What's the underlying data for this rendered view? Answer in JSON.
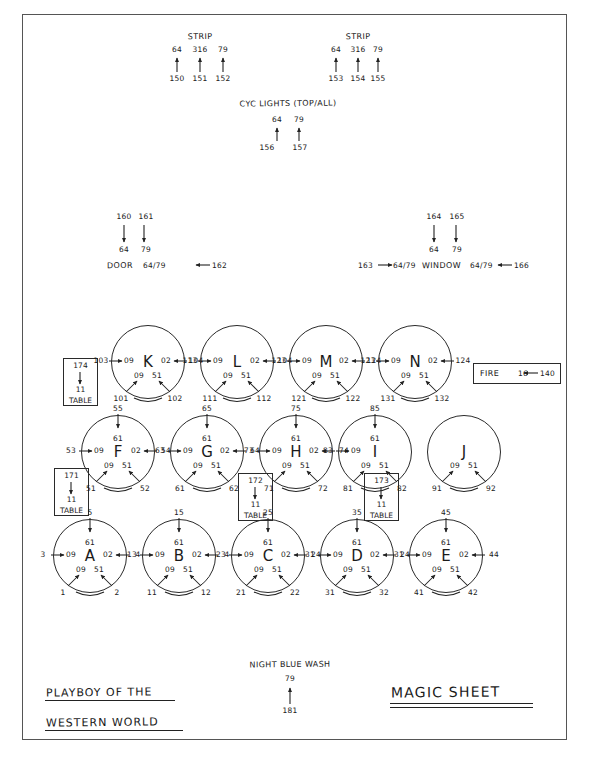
{
  "document": {
    "title_line1": "PLAYBOY OF THE",
    "title_line2": "WESTERN WORLD",
    "sheet_title": "MAGIC SHEET"
  },
  "strips": [
    {
      "name": "strip-left",
      "label": "STRIP",
      "colors": [
        "64",
        "316",
        "79"
      ],
      "channels": [
        "150",
        "151",
        "152"
      ]
    },
    {
      "name": "strip-right",
      "label": "STRIP",
      "colors": [
        "64",
        "316",
        "79"
      ],
      "channels": [
        "153",
        "154",
        "155"
      ]
    }
  ],
  "cyc": {
    "label": "CYC LIGHTS (TOP/ALL)",
    "colors": [
      "64",
      "79"
    ],
    "channels": [
      "156",
      "157"
    ]
  },
  "door": {
    "label": "DOOR",
    "top_channels": [
      "160",
      "161"
    ],
    "top_colors": [
      "64",
      "79"
    ],
    "side_channel": "162",
    "side_colors": "64/79"
  },
  "window": {
    "label": "WINDOW",
    "top_channels": [
      "164",
      "165"
    ],
    "top_colors": [
      "64",
      "79"
    ],
    "left_channel": "163",
    "left_colors": "64/79",
    "right_channel": "166",
    "right_colors": "64/79"
  },
  "fire": {
    "label": "FIRE",
    "color": "16",
    "channel": "140"
  },
  "night_blue_wash": {
    "label": "NIGHT BLUE WASH",
    "color": "79",
    "channel": "181"
  },
  "tables": [
    {
      "name": "table-box-1",
      "channel": "174",
      "color": "11",
      "label": "TABLE"
    },
    {
      "name": "table-box-2",
      "channel": "171",
      "color": "11",
      "label": "TABLE"
    },
    {
      "name": "table-box-3",
      "channel": "172",
      "color": "11",
      "label": "TABLE"
    },
    {
      "name": "table-box-4",
      "channel": "173",
      "color": "11",
      "label": "TABLE"
    }
  ],
  "areas": [
    {
      "letter": "K",
      "row": 1,
      "left_channel": "103",
      "left_color": "09",
      "right_color": "02",
      "right_channel": "104",
      "down_colors": [
        "09",
        "51"
      ],
      "down_channels": [
        "101",
        "102"
      ],
      "top_channel": "",
      "top_color": ""
    },
    {
      "letter": "L",
      "row": 1,
      "left_channel": "113",
      "left_color": "09",
      "right_color": "02",
      "right_channel": "104",
      "down_colors": [
        "09",
        "51"
      ],
      "down_channels": [
        "111",
        "112"
      ],
      "top_channel": "",
      "top_color": ""
    },
    {
      "letter": "M",
      "row": 1,
      "left_channel": "123",
      "left_color": "09",
      "right_color": "02",
      "right_channel": "124",
      "down_colors": [
        "09",
        "51"
      ],
      "down_channels": [
        "121",
        "122"
      ],
      "top_channel": "",
      "top_color": ""
    },
    {
      "letter": "N",
      "row": 1,
      "left_channel": "123",
      "left_color": "09",
      "right_color": "02",
      "right_channel": "124",
      "down_colors": [
        "09",
        "51"
      ],
      "down_channels": [
        "131",
        "132"
      ],
      "top_channel": "",
      "top_color": ""
    },
    {
      "letter": "F",
      "row": 2,
      "left_channel": "53",
      "left_color": "09",
      "right_color": "02",
      "right_channel": "54",
      "down_colors": [
        "09",
        "51"
      ],
      "down_channels": [
        "51",
        "52"
      ],
      "top_channel": "55",
      "top_color": "61"
    },
    {
      "letter": "G",
      "row": 2,
      "left_channel": "63",
      "left_color": "09",
      "right_color": "02",
      "right_channel": "64",
      "down_colors": [
        "09",
        "51"
      ],
      "down_channels": [
        "61",
        "62"
      ],
      "top_channel": "65",
      "top_color": "61"
    },
    {
      "letter": "H",
      "row": 2,
      "left_channel": "73",
      "left_color": "09",
      "right_color": "02",
      "right_channel": "74",
      "down_colors": [
        "09",
        "51"
      ],
      "down_channels": [
        "71",
        "72"
      ],
      "top_channel": "75",
      "top_color": "61"
    },
    {
      "letter": "I",
      "row": 2,
      "left_channel": "83",
      "left_color": "09",
      "right_color": "",
      "right_channel": "",
      "down_colors": [
        "09",
        "51"
      ],
      "down_channels": [
        "81",
        "82"
      ],
      "top_channel": "85",
      "top_color": "61"
    },
    {
      "letter": "J",
      "row": 2,
      "left_channel": "",
      "left_color": "",
      "right_color": "",
      "right_channel": "",
      "down_colors": [
        "09",
        "51"
      ],
      "down_channels": [
        "91",
        "92"
      ],
      "top_channel": "",
      "top_color": ""
    },
    {
      "letter": "A",
      "row": 3,
      "left_channel": "3",
      "left_color": "09",
      "right_color": "02",
      "right_channel": "4",
      "down_colors": [
        "09",
        "51"
      ],
      "down_channels": [
        "1",
        "2"
      ],
      "top_channel": "5",
      "top_color": "61"
    },
    {
      "letter": "B",
      "row": 3,
      "left_channel": "13",
      "left_color": "09",
      "right_color": "02",
      "right_channel": "4",
      "down_colors": [
        "09",
        "51"
      ],
      "down_channels": [
        "11",
        "12"
      ],
      "top_channel": "15",
      "top_color": "61"
    },
    {
      "letter": "C",
      "row": 3,
      "left_channel": "23",
      "left_color": "09",
      "right_color": "02",
      "right_channel": "24",
      "down_colors": [
        "09",
        "51"
      ],
      "down_channels": [
        "21",
        "22"
      ],
      "top_channel": "25",
      "top_color": "61"
    },
    {
      "letter": "D",
      "row": 3,
      "left_channel": "31",
      "left_color": "09",
      "right_color": "02",
      "right_channel": "24",
      "down_colors": [
        "09",
        "51"
      ],
      "down_channels": [
        "31",
        "32"
      ],
      "top_channel": "35",
      "top_color": "61"
    },
    {
      "letter": "E",
      "row": 3,
      "left_channel": "31",
      "left_color": "09",
      "right_color": "02",
      "right_channel": "44",
      "down_colors": [
        "09",
        "51"
      ],
      "down_channels": [
        "41",
        "42"
      ],
      "top_channel": "45",
      "top_color": "61"
    }
  ]
}
